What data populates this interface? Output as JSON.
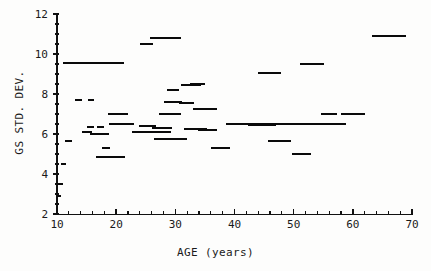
{
  "chart_data": {
    "type": "range-bar",
    "title": "",
    "xlabel": "AGE (years)",
    "ylabel": "GS STD. DEV.",
    "xlim": [
      10,
      70
    ],
    "ylim": [
      2,
      12
    ],
    "grid": false,
    "legend": null,
    "x_ticks": [
      10,
      20,
      30,
      40,
      50,
      60,
      70
    ],
    "x_tick_labels": [
      "10",
      "20",
      "30",
      "40",
      "50",
      "60",
      "70"
    ],
    "x_minor_tick_step": 2,
    "y_ticks": [
      2,
      4,
      6,
      8,
      10,
      12
    ],
    "y_tick_labels": [
      "2",
      "4",
      "6",
      "8",
      "10",
      "12"
    ],
    "y_minor_tick_step": 0.5,
    "segment_note": "Each datum is a horizontal line segment: a constant GS STD. DEV. value spanning an age interval [x_start, x_end].",
    "segments": [
      {
        "x_start": 10.0,
        "x_end": 10.6,
        "y": 2.9
      },
      {
        "x_start": 10.0,
        "x_end": 11.0,
        "y": 3.5
      },
      {
        "x_start": 10.7,
        "x_end": 11.6,
        "y": 4.5
      },
      {
        "x_start": 11.0,
        "x_end": 21.3,
        "y": 9.55
      },
      {
        "x_start": 11.4,
        "x_end": 12.6,
        "y": 5.65
      },
      {
        "x_start": 13.0,
        "x_end": 14.2,
        "y": 7.7
      },
      {
        "x_start": 15.2,
        "x_end": 16.3,
        "y": 7.7
      },
      {
        "x_start": 14.3,
        "x_end": 16.0,
        "y": 6.1
      },
      {
        "x_start": 15.0,
        "x_end": 16.2,
        "y": 6.35
      },
      {
        "x_start": 16.8,
        "x_end": 18.0,
        "y": 6.35
      },
      {
        "x_start": 15.6,
        "x_end": 18.8,
        "y": 6.0
      },
      {
        "x_start": 17.6,
        "x_end": 18.9,
        "y": 5.3
      },
      {
        "x_start": 16.6,
        "x_end": 21.5,
        "y": 4.85
      },
      {
        "x_start": 18.6,
        "x_end": 22.0,
        "y": 7.0
      },
      {
        "x_start": 18.8,
        "x_end": 23.0,
        "y": 6.5
      },
      {
        "x_start": 22.6,
        "x_end": 25.2,
        "y": 6.1
      },
      {
        "x_start": 23.9,
        "x_end": 26.8,
        "y": 6.4
      },
      {
        "x_start": 24.0,
        "x_end": 26.3,
        "y": 10.5
      },
      {
        "x_start": 25.8,
        "x_end": 31.0,
        "y": 10.8
      },
      {
        "x_start": 25.0,
        "x_end": 29.2,
        "y": 6.1
      },
      {
        "x_start": 26.0,
        "x_end": 29.4,
        "y": 6.3
      },
      {
        "x_start": 26.4,
        "x_end": 32.0,
        "y": 5.75
      },
      {
        "x_start": 27.2,
        "x_end": 31.0,
        "y": 7.0
      },
      {
        "x_start": 28.0,
        "x_end": 31.2,
        "y": 7.6
      },
      {
        "x_start": 28.6,
        "x_end": 30.6,
        "y": 8.2
      },
      {
        "x_start": 30.6,
        "x_end": 33.2,
        "y": 7.55
      },
      {
        "x_start": 31.0,
        "x_end": 34.4,
        "y": 8.45
      },
      {
        "x_start": 31.5,
        "x_end": 35.4,
        "y": 6.25
      },
      {
        "x_start": 32.4,
        "x_end": 35.0,
        "y": 8.5
      },
      {
        "x_start": 33.0,
        "x_end": 37.0,
        "y": 7.25
      },
      {
        "x_start": 33.8,
        "x_end": 37.0,
        "y": 6.2
      },
      {
        "x_start": 36.0,
        "x_end": 39.2,
        "y": 5.3
      },
      {
        "x_start": 38.6,
        "x_end": 42.8,
        "y": 6.5
      },
      {
        "x_start": 42.2,
        "x_end": 47.0,
        "y": 6.45
      },
      {
        "x_start": 42.8,
        "x_end": 58.9,
        "y": 6.5
      },
      {
        "x_start": 44.0,
        "x_end": 47.9,
        "y": 9.05
      },
      {
        "x_start": 45.6,
        "x_end": 49.6,
        "y": 5.65
      },
      {
        "x_start": 49.8,
        "x_end": 53.0,
        "y": 5.0
      },
      {
        "x_start": 51.0,
        "x_end": 55.2,
        "y": 9.5
      },
      {
        "x_start": 54.6,
        "x_end": 57.4,
        "y": 7.0
      },
      {
        "x_start": 58.0,
        "x_end": 62.0,
        "y": 7.0
      },
      {
        "x_start": 63.2,
        "x_end": 69.0,
        "y": 10.9
      }
    ]
  }
}
